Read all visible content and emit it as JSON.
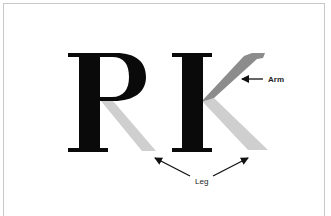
{
  "figure": {
    "letters": [
      "R",
      "K"
    ],
    "labels": {
      "arm": "Arm",
      "leg": "Leg"
    },
    "colors": {
      "glyph": "#0a0a0a",
      "leg_highlight": "#cfcfcf",
      "arm_highlight": "#8c8c8c",
      "arrow": "#111111",
      "border": "#c8c8c8",
      "background": "#ffffff"
    }
  }
}
